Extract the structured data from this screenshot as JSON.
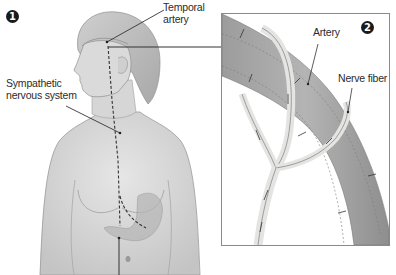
{
  "figure": {
    "panel_1": {
      "badge": "1",
      "labels": {
        "temporal_artery_line1": "Temporal",
        "temporal_artery_line2": "artery",
        "sympathetic_line1": "Sympathetic",
        "sympathetic_line2": "nervous system"
      }
    },
    "panel_2": {
      "badge": "2",
      "labels": {
        "artery": "Artery",
        "nerve_fiber": "Nerve fiber"
      }
    },
    "colors": {
      "skin": "#d9d9d9",
      "skin_shadow": "#b8b8b8",
      "artery": "#a9a9a9",
      "nerve": "#e8e8e6",
      "leader_line": "#333333",
      "badge": "#1a1a1a",
      "inset_border": "#8a8a8a"
    }
  }
}
